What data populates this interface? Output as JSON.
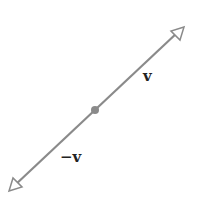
{
  "diagram": {
    "title": "",
    "labels": {
      "positive": "v",
      "negative": "−v"
    },
    "colors": {
      "line": "#8a8a8a",
      "arrowhead_stroke": "#8a8a8a",
      "arrowhead_fill": "#ffffff",
      "origin_dot": "#8a8a8a",
      "text": "#222222"
    },
    "geometry": {
      "origin": [
        95,
        110
      ],
      "tip_positive": [
        183,
        27
      ],
      "tip_negative": [
        10,
        190
      ]
    }
  }
}
